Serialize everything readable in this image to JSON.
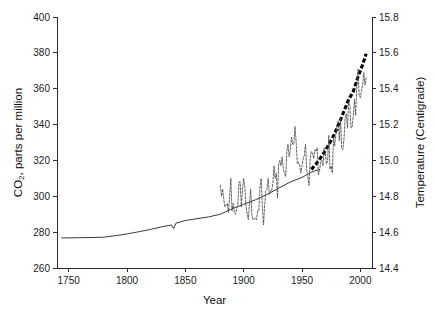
{
  "chart_data": {
    "type": "line",
    "title": "",
    "xlabel": "Year",
    "ylabel": "CO2, parts per million",
    "ylabel_main": "CO",
    "ylabel_sub": "2",
    "ylabel_rest": ", parts per million",
    "y2label": "Temperature (Centigrade)",
    "xlim": [
      1740,
      2010
    ],
    "ylim": [
      260,
      400
    ],
    "y2lim": [
      14.4,
      15.8
    ],
    "grid": false,
    "legend": "none",
    "xticks": [
      1750,
      1800,
      1850,
      1900,
      1950,
      2000
    ],
    "xtick_labels": [
      "1750",
      "1800",
      "1850",
      "1900",
      "1950",
      "2000"
    ],
    "yticks": [
      260,
      280,
      300,
      320,
      340,
      360,
      380,
      400
    ],
    "ytick_labels": [
      "260",
      "280",
      "300",
      "320",
      "340",
      "360",
      "380",
      "400"
    ],
    "y2ticks": [
      14.4,
      14.6,
      14.8,
      15.0,
      15.2,
      15.4,
      15.6,
      15.8
    ],
    "y2tick_labels": [
      "14.4",
      "14.6",
      "14.8",
      "15.0",
      "15.2",
      "15.4",
      "15.6",
      "15.8"
    ],
    "series": [
      {
        "name": "CO2 ice core (solid thin line)",
        "axis": "left",
        "style": "solid",
        "units": "ppm",
        "x": [
          1744,
          1750,
          1760,
          1770,
          1780,
          1790,
          1800,
          1810,
          1820,
          1830,
          1838,
          1840,
          1842,
          1850,
          1860,
          1870,
          1880,
          1890,
          1900,
          1910,
          1920,
          1930,
          1940,
          1950,
          1958,
          1965
        ],
        "values": [
          276.8,
          276.8,
          276.9,
          277.0,
          277.2,
          278.0,
          279.0,
          280.2,
          281.5,
          283.0,
          284.0,
          282.0,
          285.0,
          286.5,
          287.5,
          288.5,
          290.0,
          293.0,
          295.5,
          298.0,
          301.0,
          304.5,
          308.0,
          310.5,
          313.5,
          315.0
        ]
      },
      {
        "name": "CO2 Mauna Loa (thick dashed line)",
        "axis": "left",
        "style": "thick-dashed",
        "units": "ppm",
        "x": [
          1958,
          1962,
          1966,
          1970,
          1974,
          1978,
          1982,
          1986,
          1990,
          1994,
          1998,
          2002,
          2005
        ],
        "values": [
          315.0,
          318.0,
          321.5,
          325.5,
          330.0,
          335.0,
          341.0,
          347.5,
          354.0,
          358.5,
          366.5,
          373.5,
          379.5
        ]
      },
      {
        "name": "Global mean temperature (thin dashed jagged line)",
        "axis": "right",
        "style": "dashed",
        "units": "degC",
        "x": [
          1880,
          1881,
          1882,
          1883,
          1884,
          1885,
          1886,
          1887,
          1888,
          1889,
          1890,
          1891,
          1892,
          1893,
          1894,
          1895,
          1896,
          1897,
          1898,
          1899,
          1900,
          1901,
          1902,
          1903,
          1904,
          1905,
          1906,
          1907,
          1908,
          1909,
          1910,
          1911,
          1912,
          1913,
          1914,
          1915,
          1916,
          1917,
          1918,
          1919,
          1920,
          1921,
          1922,
          1923,
          1924,
          1925,
          1926,
          1927,
          1928,
          1929,
          1930,
          1931,
          1932,
          1933,
          1934,
          1935,
          1936,
          1937,
          1938,
          1939,
          1940,
          1941,
          1942,
          1943,
          1944,
          1945,
          1946,
          1947,
          1948,
          1949,
          1950,
          1951,
          1952,
          1953,
          1954,
          1955,
          1956,
          1957,
          1958,
          1959,
          1960,
          1961,
          1962,
          1963,
          1964,
          1965,
          1966,
          1967,
          1968,
          1969,
          1970,
          1971,
          1972,
          1973,
          1974,
          1975,
          1976,
          1977,
          1978,
          1979,
          1980,
          1981,
          1982,
          1983,
          1984,
          1985,
          1986,
          1987,
          1988,
          1989,
          1990,
          1991,
          1992,
          1993,
          1994,
          1995,
          1996,
          1997,
          1998,
          1999,
          2000,
          2001,
          2002,
          2003,
          2004,
          2005
        ],
        "values": [
          14.86,
          14.8,
          14.84,
          14.78,
          14.74,
          14.75,
          14.76,
          14.71,
          14.8,
          14.9,
          14.72,
          14.76,
          14.71,
          14.7,
          14.73,
          14.75,
          14.88,
          14.88,
          14.74,
          14.84,
          14.9,
          14.85,
          14.75,
          14.7,
          14.67,
          14.76,
          14.84,
          14.7,
          14.67,
          14.67,
          14.68,
          14.67,
          14.72,
          14.72,
          14.85,
          14.9,
          14.75,
          14.64,
          14.75,
          14.83,
          14.84,
          14.9,
          14.81,
          14.83,
          14.83,
          14.87,
          14.97,
          14.9,
          14.93,
          14.79,
          14.98,
          15.0,
          14.97,
          15.02,
          14.95,
          14.93,
          14.91,
          15.05,
          15.09,
          15.02,
          15.06,
          15.13,
          15.09,
          15.09,
          15.19,
          15.1,
          14.98,
          14.99,
          14.97,
          14.93,
          14.97,
          15.01,
          15.03,
          15.09,
          14.95,
          14.91,
          14.86,
          15.01,
          15.05,
          15.04,
          15.01,
          15.06,
          15.05,
          15.07,
          14.92,
          14.94,
          14.99,
          15.0,
          14.97,
          15.07,
          15.04,
          14.98,
          15.0,
          15.14,
          14.95,
          14.97,
          14.93,
          15.13,
          15.08,
          15.14,
          15.2,
          15.22,
          15.11,
          15.24,
          15.07,
          15.06,
          15.12,
          15.24,
          15.26,
          15.18,
          15.33,
          15.31,
          15.18,
          15.19,
          15.25,
          15.34,
          15.25,
          15.42,
          15.51,
          15.36,
          15.35,
          15.39,
          15.42,
          15.49,
          15.42,
          15.46
        ]
      }
    ]
  },
  "axes": {
    "x_title": "Year",
    "y_title_main": "CO",
    "y_title_sub": "2",
    "y_title_rest": ", parts per million",
    "y2_title": "Temperature (Centigrade)"
  },
  "colors": {
    "axis": "#2b2b2b",
    "co2_ice": "#3a3a3a",
    "co2_modern": "#000000",
    "temperature": "#4a4a4a",
    "background": "#ffffff"
  }
}
